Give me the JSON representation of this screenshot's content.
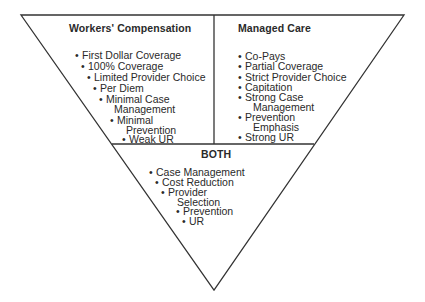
{
  "diagram": {
    "type": "inverted-triangle-comparison",
    "sections": {
      "left": {
        "title": "Workers' Compensation",
        "items": [
          "First Dollar Coverage",
          "100% Coverage",
          "Limited Provider Choice",
          "Per Diem",
          "Minimal Case",
          "Management",
          "Minimal",
          "Prevention",
          "Weak UR"
        ]
      },
      "right": {
        "title": "Managed Care",
        "items": [
          "Co-Pays",
          "Partial Coverage",
          "Strict Provider Choice",
          "Capitation",
          "Strong Case",
          "Management",
          "Prevention",
          "Emphasis",
          "Strong UR"
        ]
      },
      "bottom": {
        "title": "BOTH",
        "items": [
          "Case Management",
          "Cost Reduction",
          "Provider",
          "Selection",
          "Prevention",
          "UR"
        ]
      }
    },
    "bullet_glyph": "•",
    "line_color": "#333333"
  }
}
